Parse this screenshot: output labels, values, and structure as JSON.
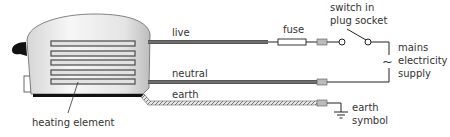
{
  "diagram": {
    "labels": {
      "live": "live",
      "neutral": "neutral",
      "earth": "earth",
      "fuse": "fuse",
      "switch_line1": "switch in",
      "switch_line2": "plug socket",
      "mains_line1": "mains",
      "mains_line2": "electricity",
      "mains_line3": "supply",
      "earth_symbol_line1": "earth",
      "earth_symbol_line2": "symbol",
      "heating_element": "heating element"
    },
    "ac_symbol": "~",
    "colors": {
      "wire": "#555555",
      "wire_core": "#777777",
      "line": "#222222",
      "connector": "#bbbbbb",
      "body_light": "#f4f4f4",
      "body_dark": "#c8c8c8"
    }
  }
}
